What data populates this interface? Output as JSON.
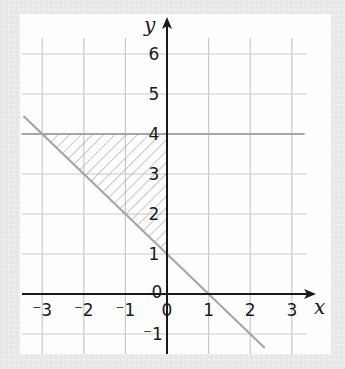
{
  "chart_data": {
    "type": "line",
    "title": "",
    "xlabel": "x",
    "ylabel": "y",
    "xlim": [
      -3.5,
      3.5
    ],
    "ylim": [
      -1.5,
      6.5
    ],
    "grid": true,
    "x_ticks": [
      -3,
      -2,
      -1,
      0,
      1,
      2,
      3
    ],
    "y_ticks": [
      -1,
      0,
      1,
      2,
      3,
      4,
      5,
      6
    ],
    "x_tick_labels": [
      "⁻3",
      "⁻2",
      "⁻1",
      "0",
      "1",
      "2",
      "3"
    ],
    "y_tick_labels": [
      "⁻1",
      "0",
      "1",
      "2",
      "3",
      "4",
      "5",
      "6"
    ],
    "series": [
      {
        "name": "y = 4",
        "type": "horizontal-line",
        "equation": "y = 4",
        "x": [
          -3.5,
          3.3
        ],
        "y": [
          4,
          4
        ],
        "color": "#a6a6a6"
      },
      {
        "name": "x + y = 1",
        "type": "line",
        "equation": "y = 1 - x",
        "x": [
          -3.45,
          2.35
        ],
        "y": [
          4.45,
          -1.35
        ],
        "color": "#a6a6a6"
      }
    ],
    "shaded_region": {
      "description": "Hatched triangle bounded by y = 4, x + y = 1 and x = 0",
      "vertices": [
        [
          -3,
          4
        ],
        [
          0,
          4
        ],
        [
          0,
          1
        ]
      ],
      "pattern": "diagonal-hatch"
    }
  },
  "labels": {
    "x_axis": "x",
    "y_axis": "y"
  }
}
